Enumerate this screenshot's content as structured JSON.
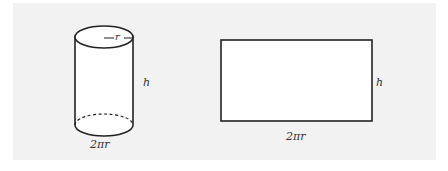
{
  "figure": {
    "background_color": "#f2f2f2",
    "stroke_color": "#222222",
    "cylinder": {
      "radius_label": "r",
      "height_label": "h",
      "circumference_label": "2πr"
    },
    "rectangle": {
      "height_label": "h",
      "width_label": "2πr"
    }
  }
}
